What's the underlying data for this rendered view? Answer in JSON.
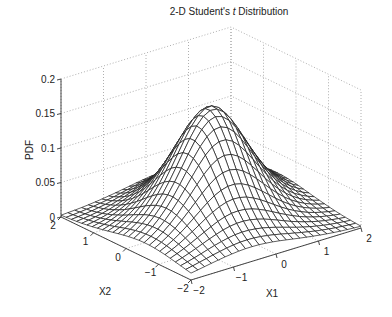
{
  "chart_data": {
    "type": "surface",
    "title": "2-D Student's t Distribution",
    "title_parts": [
      "2-D Student's ",
      "t",
      " Distribution"
    ],
    "xlabel": "X1",
    "ylabel": "X2",
    "zlabel": "PDF",
    "distribution": {
      "name": "bivariate Student's t",
      "rho": 0.3,
      "nu": 5
    },
    "x1_range": [
      -2,
      2
    ],
    "x2_range": [
      -2,
      2
    ],
    "grid_points": 26,
    "zlim": [
      0,
      0.2
    ],
    "peak_value": 0.167,
    "x1_ticks": [
      "-2",
      "-1",
      "0",
      "1",
      "2"
    ],
    "x2_ticks": [
      "-2",
      "-1",
      "0",
      "1",
      "2"
    ],
    "z_ticks": [
      "0",
      "0.05",
      "0.1",
      "0.15",
      "0.2"
    ],
    "grid": true,
    "colors": {
      "mesh_line": "#1a1a1a",
      "mesh_face": "#ffffff",
      "grid": "#9a9a9a",
      "axis": "#333333"
    }
  }
}
